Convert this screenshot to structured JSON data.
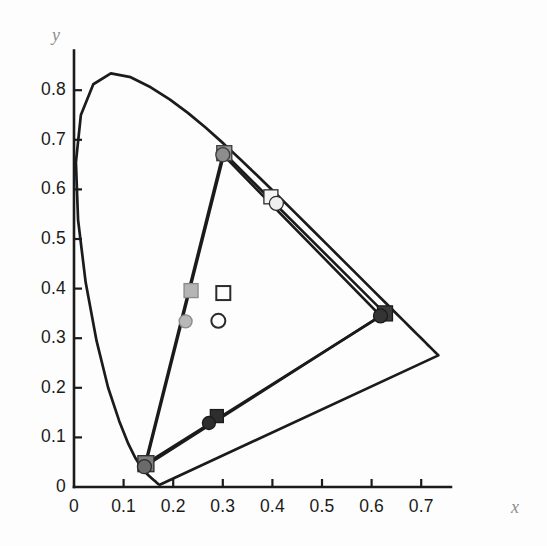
{
  "figure": {
    "kind": "cie-1931-chromaticity-diagram",
    "background_color": "#fdfdfd",
    "axis_color": "#1b1b1b",
    "curve_color": "#1b1b1b"
  },
  "axes": {
    "x_axis": {
      "title": "x",
      "title_color": "#8e8e8e",
      "min": 0,
      "max": 0.76,
      "tick_values": [
        0,
        0.1,
        0.2,
        0.3,
        0.4,
        0.5,
        0.6,
        0.7
      ],
      "tick_labels": [
        "0",
        "0.1",
        "0.2",
        "0.3",
        "0.4",
        "0.5",
        "0.6",
        "0.7"
      ]
    },
    "y_axis": {
      "title": "y",
      "title_color": "#8e8e8e",
      "min": 0,
      "max": 0.88,
      "tick_values": [
        0,
        0.1,
        0.2,
        0.3,
        0.4,
        0.5,
        0.6,
        0.7,
        0.8
      ],
      "tick_labels": [
        "0",
        "0.1",
        "0.2",
        "0.3",
        "0.4",
        "0.5",
        "0.6",
        "0.7",
        "0.8"
      ]
    }
  },
  "chart_data": {
    "type": "scatter",
    "title": "",
    "xlabel": "x",
    "ylabel": "y",
    "xlim": [
      0,
      0.76
    ],
    "ylim": [
      0,
      0.88
    ],
    "grid": false,
    "legend": "none",
    "spectral_locus": {
      "name": "spectral-locus",
      "closed": true,
      "color": "#1b1b1b",
      "points": [
        [
          0.1741,
          0.005
        ],
        [
          0.174,
          0.005
        ],
        [
          0.1738,
          0.0049
        ],
        [
          0.1736,
          0.0049
        ],
        [
          0.1733,
          0.0048
        ],
        [
          0.173,
          0.0048
        ],
        [
          0.1726,
          0.0048
        ],
        [
          0.1721,
          0.0048
        ],
        [
          0.1714,
          0.0051
        ],
        [
          0.1703,
          0.0058
        ],
        [
          0.1689,
          0.0069
        ],
        [
          0.1669,
          0.0086
        ],
        [
          0.1644,
          0.0109
        ],
        [
          0.1611,
          0.0138
        ],
        [
          0.1566,
          0.0177
        ],
        [
          0.151,
          0.0227
        ],
        [
          0.144,
          0.0297
        ],
        [
          0.1355,
          0.0399
        ],
        [
          0.1241,
          0.0578
        ],
        [
          0.1096,
          0.0868
        ],
        [
          0.0913,
          0.1327
        ],
        [
          0.0687,
          0.2007
        ],
        [
          0.0454,
          0.295
        ],
        [
          0.0235,
          0.4127
        ],
        [
          0.0082,
          0.5384
        ],
        [
          0.0039,
          0.6548
        ],
        [
          0.0139,
          0.7502
        ],
        [
          0.0389,
          0.812
        ],
        [
          0.0743,
          0.8338
        ],
        [
          0.1142,
          0.8262
        ],
        [
          0.1547,
          0.8059
        ],
        [
          0.1929,
          0.7816
        ],
        [
          0.2296,
          0.7543
        ],
        [
          0.2658,
          0.7243
        ],
        [
          0.3016,
          0.6923
        ],
        [
          0.3373,
          0.6589
        ],
        [
          0.3731,
          0.6245
        ],
        [
          0.4087,
          0.5896
        ],
        [
          0.4441,
          0.5547
        ],
        [
          0.4788,
          0.5202
        ],
        [
          0.5125,
          0.4866
        ],
        [
          0.5448,
          0.4544
        ],
        [
          0.5752,
          0.4242
        ],
        [
          0.6029,
          0.3965
        ],
        [
          0.627,
          0.3725
        ],
        [
          0.6482,
          0.3514
        ],
        [
          0.6658,
          0.334
        ],
        [
          0.6801,
          0.3197
        ],
        [
          0.6915,
          0.3083
        ],
        [
          0.7006,
          0.2993
        ],
        [
          0.7079,
          0.292
        ],
        [
          0.714,
          0.2859
        ],
        [
          0.719,
          0.2809
        ],
        [
          0.723,
          0.277
        ],
        [
          0.726,
          0.274
        ],
        [
          0.7283,
          0.2717
        ],
        [
          0.73,
          0.27
        ],
        [
          0.7311,
          0.2689
        ],
        [
          0.732,
          0.268
        ],
        [
          0.7327,
          0.2673
        ],
        [
          0.7334,
          0.2666
        ],
        [
          0.734,
          0.266
        ],
        [
          0.7344,
          0.2656
        ],
        [
          0.7346,
          0.2654
        ]
      ]
    },
    "gamut_triangles": [
      {
        "name": "gamut-squares",
        "marker": "square",
        "vertices": [
          {
            "label": "blue-primary-square",
            "x": 0.145,
            "y": 0.047,
            "color": "#6f6f6f"
          },
          {
            "label": "green-primary-square",
            "x": 0.303,
            "y": 0.673,
            "color": "#9a9a9a"
          },
          {
            "label": "red-primary-square",
            "x": 0.627,
            "y": 0.35,
            "color": "#3a3a3a"
          }
        ]
      },
      {
        "name": "gamut-circles",
        "marker": "circle",
        "vertices": [
          {
            "label": "blue-primary-circle",
            "x": 0.142,
            "y": 0.041,
            "color": "#5e5e5e"
          },
          {
            "label": "green-primary-circle",
            "x": 0.3,
            "y": 0.67,
            "color": "#8d8d8d"
          },
          {
            "label": "red-primary-circle",
            "x": 0.618,
            "y": 0.345,
            "color": "#343434"
          }
        ]
      }
    ],
    "markers": [
      {
        "name": "green-vertex-square",
        "shape": "square",
        "x": 0.303,
        "y": 0.673,
        "fill": "#9a9a9a",
        "stroke": "#3c3c3c",
        "size": 15,
        "filled": true
      },
      {
        "name": "green-vertex-circle",
        "shape": "circle",
        "x": 0.3,
        "y": 0.67,
        "fill": "#8d8d8d",
        "stroke": "#3c3c3c",
        "size": 14,
        "filled": true
      },
      {
        "name": "white-point-square-upper",
        "shape": "square",
        "x": 0.397,
        "y": 0.585,
        "fill": "#f4f4f4",
        "stroke": "#2b2b2b",
        "size": 14,
        "filled": true
      },
      {
        "name": "white-point-circle-upper",
        "shape": "circle",
        "x": 0.408,
        "y": 0.572,
        "fill": "#efefef",
        "stroke": "#2b2b2b",
        "size": 14,
        "filled": true
      },
      {
        "name": "red-vertex-square",
        "shape": "square",
        "x": 0.627,
        "y": 0.35,
        "fill": "#3a3a3a",
        "stroke": "#1b1b1b",
        "size": 15,
        "filled": true
      },
      {
        "name": "red-vertex-circle",
        "shape": "circle",
        "x": 0.618,
        "y": 0.345,
        "fill": "#343434",
        "stroke": "#1b1b1b",
        "size": 14,
        "filled": true
      },
      {
        "name": "blue-vertex-square",
        "shape": "square",
        "x": 0.145,
        "y": 0.047,
        "fill": "#7d7d7d",
        "stroke": "#2b2b2b",
        "size": 16,
        "filled": true
      },
      {
        "name": "blue-vertex-circle",
        "shape": "circle",
        "x": 0.142,
        "y": 0.041,
        "fill": "#6a6a6a",
        "stroke": "#2b2b2b",
        "size": 14,
        "filled": true
      },
      {
        "name": "mid-line-square-dark",
        "shape": "square",
        "x": 0.288,
        "y": 0.143,
        "fill": "#2e2e2e",
        "stroke": "#1b1b1b",
        "size": 13,
        "filled": true
      },
      {
        "name": "mid-line-circle-dark",
        "shape": "circle",
        "x": 0.272,
        "y": 0.129,
        "fill": "#2e2e2e",
        "stroke": "#1b1b1b",
        "size": 13,
        "filled": true
      },
      {
        "name": "mid-line-square-light",
        "shape": "square",
        "x": 0.236,
        "y": 0.396,
        "fill": "#b4b4b4",
        "stroke": "#8a8a8a",
        "size": 14,
        "filled": true
      },
      {
        "name": "mid-line-circle-light",
        "shape": "circle",
        "x": 0.225,
        "y": 0.334,
        "fill": "#b8b8b8",
        "stroke": "#8a8a8a",
        "size": 13,
        "filled": true
      },
      {
        "name": "white-point-square-open",
        "shape": "square",
        "x": 0.301,
        "y": 0.391,
        "fill": "none",
        "stroke": "#2b2b2b",
        "size": 14,
        "filled": false
      },
      {
        "name": "white-point-circle-open",
        "shape": "circle",
        "x": 0.291,
        "y": 0.335,
        "fill": "none",
        "stroke": "#2b2b2b",
        "size": 14,
        "filled": false
      }
    ]
  }
}
